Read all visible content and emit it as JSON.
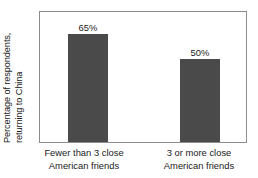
{
  "chart_data": {
    "type": "bar",
    "title": "",
    "xlabel": "",
    "ylabel_line1": "Percentage of respondents,",
    "ylabel_line2": "returning to China",
    "ylim": [
      0,
      78
    ],
    "grid": false,
    "legend": null,
    "bar_color": "#4a4a4a",
    "frame_color": "#8c8c8c",
    "background_color": "#ffffff",
    "categories": [
      "Fewer than 3 close American friends",
      "3 or more close American friends"
    ],
    "category_lines": [
      [
        "Fewer than 3 close",
        "American friends"
      ],
      [
        "3 or more close",
        "American friends"
      ]
    ],
    "values": [
      65,
      50
    ],
    "data_labels": [
      "65%",
      "50%"
    ]
  }
}
